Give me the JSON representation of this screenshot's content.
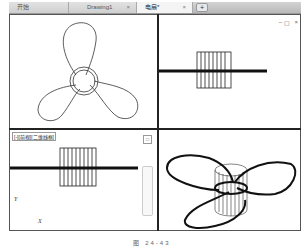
{
  "tabs": [
    {
      "label": "开始",
      "active": false
    },
    {
      "label": "Drawing1",
      "active": false,
      "close": "×"
    },
    {
      "label": "电扇*",
      "active": true,
      "close": "×"
    }
  ],
  "tab_add_label": "+",
  "viewports": {
    "top_left": {
      "view": "top",
      "content": "three-blade fan outline with hub circles"
    },
    "top_right": {
      "view": "front",
      "content": "hub cylinder with horizontal blade line",
      "window_controls": [
        "–",
        "▢",
        "×"
      ]
    },
    "bottom_left": {
      "label": "[-][前视][二维线框]",
      "axis_y": "Y",
      "axis_x": "X",
      "view_cube": "□"
    },
    "bottom_right": {
      "view": "isometric",
      "content": "3D fan with cylindrical hub"
    }
  },
  "caption": "图 24-43"
}
